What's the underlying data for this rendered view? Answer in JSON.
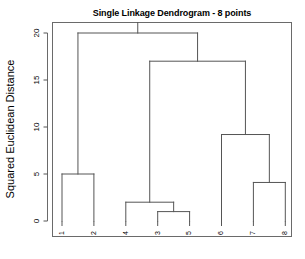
{
  "figure": {
    "title": "Single Linkage Dendrogram - 8 points",
    "y_axis_label": "Squared Euclidean Distance",
    "background_color": "#ffffff",
    "line_color": "#555555",
    "text_color": "#000000"
  },
  "chart_data": {
    "type": "line",
    "plot_kind": "dendrogram",
    "title": "Single Linkage Dendrogram - 8 points",
    "xlabel": "",
    "ylabel": "Squared Euclidean Distance",
    "ylim": [
      0,
      20
    ],
    "yticks": [
      0,
      5,
      10,
      15,
      20
    ],
    "ytick_labels": [
      "0",
      "5",
      "10",
      "15",
      "20"
    ],
    "grid": false,
    "legend": null,
    "leaf_order": [
      1,
      2,
      4,
      3,
      5,
      6,
      7,
      8
    ],
    "leaf_labels": [
      "1",
      "2",
      "4",
      "3",
      "5",
      "6",
      "7",
      "8"
    ],
    "leaf_label_rotation": 90,
    "n_points": 8,
    "linkage_method": "single",
    "merges": [
      {
        "id": "m1",
        "left": "3",
        "right": "5",
        "height": 1.0
      },
      {
        "id": "m2",
        "left": "4",
        "right": "m1",
        "height": 2.0
      },
      {
        "id": "m3",
        "left": "7",
        "right": "8",
        "height": 4.1
      },
      {
        "id": "m4",
        "left": "1",
        "right": "2",
        "height": 5.0
      },
      {
        "id": "m5",
        "left": "6",
        "right": "m3",
        "height": 9.2
      },
      {
        "id": "m6",
        "left": "m2",
        "right": "m5",
        "height": 17.0
      },
      {
        "id": "m7",
        "left": "m4",
        "right": "m6",
        "height": 20.0
      }
    ],
    "merge_heights": [
      1.0,
      2.0,
      4.1,
      5.0,
      9.2,
      17.0,
      20.0
    ]
  }
}
